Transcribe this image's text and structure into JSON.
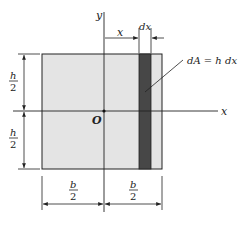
{
  "diagram": {
    "type": "cross-section-area-element",
    "colors": {
      "area_fill": "#e4e4e4",
      "strip_fill": "#474747",
      "line": "#222222",
      "background": "#ffffff"
    },
    "axes": {
      "x_label": "x",
      "y_label": "y",
      "origin_label": "O"
    },
    "dimensions": {
      "x_distance_label": "x",
      "dx_label": "dx",
      "height_top": {
        "num": "h",
        "den": "2"
      },
      "height_bottom": {
        "num": "h",
        "den": "2"
      },
      "width_left": {
        "num": "b",
        "den": "2"
      },
      "width_right": {
        "num": "b",
        "den": "2"
      }
    },
    "annotation": {
      "area_element_label": "dA = h dx"
    }
  }
}
